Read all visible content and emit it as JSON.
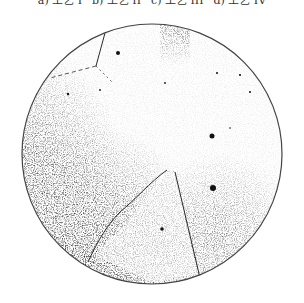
{
  "figure": {
    "caption_items": [
      {
        "label": "a) 工艺 I"
      },
      {
        "label": "b) 工艺 II"
      },
      {
        "label": "c) 工艺 III"
      },
      {
        "label": "d) 工艺 IV"
      }
    ],
    "micrograph": {
      "shape": "circle",
      "center": [
        152,
        154
      ],
      "radius": 130,
      "border_color": "#444444",
      "background": "#ffffff",
      "ink_color": "#1a1a1a"
    }
  }
}
